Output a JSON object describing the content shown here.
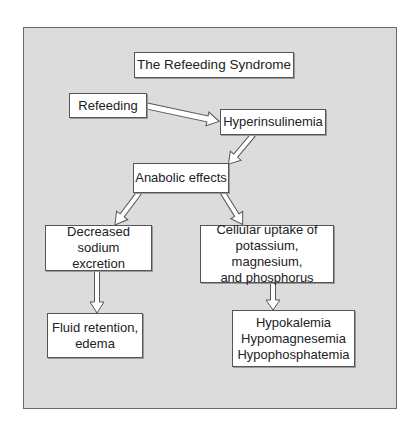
{
  "diagram": {
    "title": "The Refeeding Syndrome",
    "nodes": {
      "refeeding": "Refeeding",
      "hyperinsulinemia": "Hyperinsulinemia",
      "anabolic_effects": "Anabolic effects",
      "decreased_sodium": "Decreased sodium\nexcretion",
      "cellular_uptake": "Cellular uptake of\npotassium, magnesium,\nand phosphorus",
      "fluid_retention": "Fluid retention,\nedema",
      "electrolytes": "Hypokalemia\nHypomagnesemia\nHypophosphatemia"
    },
    "edges": [
      {
        "from": "Refeeding",
        "to": "Hyperinsulinemia"
      },
      {
        "from": "Hyperinsulinemia",
        "to": "Anabolic effects"
      },
      {
        "from": "Anabolic effects",
        "to": "Decreased sodium excretion"
      },
      {
        "from": "Anabolic effects",
        "to": "Cellular uptake of potassium, magnesium, and phosphorus"
      },
      {
        "from": "Decreased sodium excretion",
        "to": "Fluid retention, edema"
      },
      {
        "from": "Cellular uptake of potassium, magnesium, and phosphorus",
        "to": "Hypokalemia Hypomagnesemia Hypophosphatemia"
      }
    ],
    "colors": {
      "panel_background": "#dcdcdc",
      "box_background": "#ffffff",
      "border": "#555555"
    }
  }
}
